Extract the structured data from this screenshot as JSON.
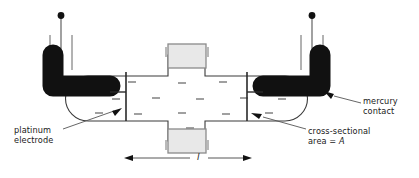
{
  "figure": {
    "type": "diagram",
    "background_color": "#ffffff",
    "line_color": "#3a3a3a",
    "mercury_color": "#111111",
    "block_fill_color": "#e8e8e8",
    "block_border_color": "#8a8a8a"
  },
  "labels": {
    "platinum_electrode": "platinum\nelectrode",
    "mercury_contact": "mercury\ncontact",
    "cross_sectional_area": "cross-sectional\narea = A",
    "cross_sectional_line1": "cross-sectional",
    "cross_sectional_line2_prefix": "area = ",
    "cross_sectional_symbol": "A",
    "length_symbol": "l"
  },
  "components": {
    "electrolyte_tube": "electrolyte-tube",
    "left_mercury": "left-mercury-contact",
    "right_mercury": "right-mercury-contact",
    "left_electrode": "left-platinum-electrode",
    "right_electrode": "right-platinum-electrode",
    "top_filling_block": "top-filling-tube-block",
    "bottom_filling_block": "bottom-filling-tube-block",
    "left_leads": "left-lead-wires",
    "right_leads": "right-lead-wires",
    "length_dimension": "length-dimension-arrow"
  },
  "dashes": {
    "note": "electrolyte solution tick marks inside tube",
    "count": 16
  }
}
